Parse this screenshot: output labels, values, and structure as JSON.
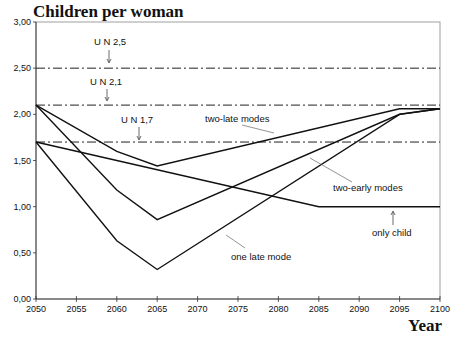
{
  "chart_data": {
    "type": "line",
    "title": "Children per woman",
    "xlabel": "Year",
    "ylabel": "Children per woman",
    "xlim": [
      2050,
      2100
    ],
    "ylim": [
      0,
      3
    ],
    "grid": false,
    "x_ticks": [
      2050,
      2055,
      2060,
      2065,
      2070,
      2075,
      2080,
      2085,
      2090,
      2095,
      2100
    ],
    "y_ticks": [
      "0,00",
      "0,50",
      "1,00",
      "1,50",
      "2,00",
      "2,50",
      "3,00"
    ],
    "reference_lines": [
      {
        "label": "U N 2,5",
        "value": 2.5
      },
      {
        "label": "U N 2,1",
        "value": 2.1
      },
      {
        "label": "U N 1,7",
        "value": 1.7
      }
    ],
    "series": [
      {
        "name": "only child",
        "x": [
          2050,
          2085,
          2100
        ],
        "values": [
          1.7,
          1.0,
          1.0
        ]
      },
      {
        "name": "one late mode",
        "x": [
          2050,
          2060,
          2065,
          2095,
          2100
        ],
        "values": [
          1.7,
          0.63,
          0.32,
          2.0,
          2.06
        ]
      },
      {
        "name": "two-early modes",
        "x": [
          2050,
          2060,
          2065,
          2095,
          2100
        ],
        "values": [
          2.1,
          1.18,
          0.86,
          2.0,
          2.06
        ]
      },
      {
        "name": "two-late modes",
        "x": [
          2050,
          2060,
          2065,
          2095,
          2100
        ],
        "values": [
          2.1,
          1.6,
          1.44,
          2.06,
          2.06
        ]
      }
    ]
  },
  "labels": {
    "title": "Children per woman",
    "xlabel": "Year",
    "un25": "U N 2,5",
    "un21": "U N 2,1",
    "un17": "U N 1,7",
    "two_late": "two-late modes",
    "two_early": "two-early modes",
    "only_child": "only child",
    "one_late": "one late mode"
  }
}
